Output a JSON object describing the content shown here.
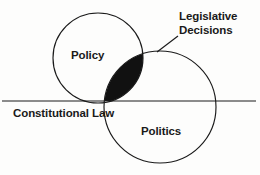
{
  "diagram": {
    "type": "venn-diagram",
    "background_color": "#fdfdfc",
    "stroke_color": "#1a1a1a",
    "fill_color": "#111111",
    "text_color": "#1a1a1a",
    "labels": {
      "policy": "Policy",
      "politics": "Politics",
      "constitutional_law": "Constitutional Law",
      "legislative_decisions_line1": "Legislative",
      "legislative_decisions_line2": "Decisions"
    },
    "shapes": {
      "policy_circle": {
        "cx": 98,
        "cy": 58,
        "r": 45
      },
      "politics_circle": {
        "cx": 160,
        "cy": 107,
        "r": 56
      },
      "horizontal_line": {
        "x1": 2,
        "y1": 101,
        "x2": 256,
        "y2": 101
      },
      "leader_line": {
        "x1": 178,
        "y1": 36,
        "x2": 157,
        "y2": 52
      }
    }
  }
}
